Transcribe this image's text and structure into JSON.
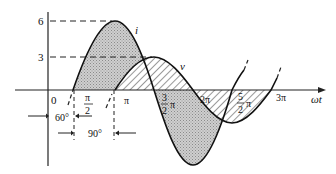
{
  "diagram": {
    "title": "",
    "axes": {
      "y_ticks": [
        {
          "label": "6",
          "value": 6
        },
        {
          "label": "3",
          "value": 3
        }
      ],
      "x_origin_label": "0",
      "x_axis_label": "ωt",
      "x_ticks": [
        {
          "num": "π",
          "den": "2",
          "value": "π/2"
        },
        {
          "label": "π",
          "value": "π"
        },
        {
          "num": "3",
          "den": "2",
          "suffix": "π",
          "value": "3π/2"
        },
        {
          "label": "2π",
          "value": "2π"
        },
        {
          "num": "5",
          "den": "2",
          "suffix": "π",
          "value": "5π/2"
        },
        {
          "label": "3π",
          "value": "3π"
        }
      ]
    },
    "curves": [
      {
        "name": "i",
        "label": "i",
        "amplitude": 6,
        "phase_shift_deg": 60,
        "fill": "stippled gray"
      },
      {
        "name": "v",
        "label": "v",
        "amplitude": 3,
        "phase_shift_deg": 150,
        "fill": "diagonal hatch"
      }
    ],
    "annotations": {
      "phase_i": "60°",
      "phase_diff": "90°"
    }
  }
}
